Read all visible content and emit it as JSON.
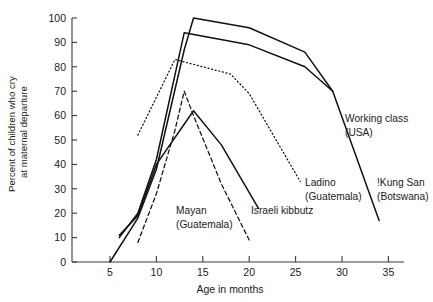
{
  "chart_data": {
    "type": "line",
    "title": "",
    "xlabel": "Age in months",
    "ylabel": "Percent of children who cry at maternal departure",
    "ylabel_line1": "Percent of children who cry",
    "ylabel_line2": "at maternal departure",
    "xlim": [
      3,
      36
    ],
    "ylim": [
      0,
      100
    ],
    "xticks": [
      5,
      10,
      15,
      20,
      25,
      30,
      35
    ],
    "yticks": [
      0,
      10,
      20,
      30,
      40,
      50,
      60,
      70,
      80,
      90,
      100
    ],
    "grid": false,
    "legend_position": "inline-annotations",
    "series": [
      {
        "name": "Working class (USA)",
        "style": "solid",
        "color": "#111111",
        "x": [
          5,
          8,
          10,
          13,
          14,
          20,
          26,
          29
        ],
        "y": [
          0,
          18,
          38,
          87,
          100,
          96,
          86,
          70
        ]
      },
      {
        "name": "!Kung San (Botswana)",
        "style": "solid",
        "color": "#111111",
        "x": [
          6,
          8,
          10,
          13,
          20,
          26,
          29,
          34
        ],
        "y": [
          10,
          20,
          42,
          94,
          89,
          80,
          70,
          17
        ]
      },
      {
        "name": "Israeli kibbutz",
        "style": "solid",
        "color": "#111111",
        "x": [
          6,
          8,
          10,
          14,
          17,
          21
        ],
        "y": [
          11,
          19,
          40,
          62,
          48,
          22
        ]
      },
      {
        "name": "Ladino (Guatemala)",
        "style": "dotted",
        "color": "#111111",
        "x": [
          8,
          12,
          18,
          20,
          25.5
        ],
        "y": [
          52,
          83,
          77,
          69,
          33
        ]
      },
      {
        "name": "Mayan (Guatemala)",
        "style": "dashed",
        "color": "#111111",
        "x": [
          8,
          10,
          12,
          13,
          14,
          17,
          20
        ],
        "y": [
          8,
          28,
          54,
          70,
          60,
          32,
          9
        ]
      }
    ],
    "annotations": [
      {
        "id": "working-class",
        "text_line1": "Working class",
        "text_line2": "(USA)"
      },
      {
        "id": "kung-san",
        "text_line1": "!Kung San",
        "text_line2": "(Botswana)"
      },
      {
        "id": "ladino",
        "text_line1": "Ladino",
        "text_line2": "(Guatemala)"
      },
      {
        "id": "israeli-kibbutz",
        "text_line1": "Israeli kibbutz",
        "text_line2": ""
      },
      {
        "id": "mayan",
        "text_line1": "Mayan",
        "text_line2": "(Guatemala)"
      }
    ]
  }
}
